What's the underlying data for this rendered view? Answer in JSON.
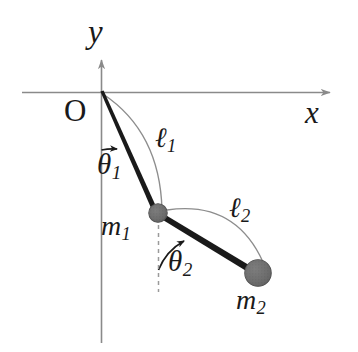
{
  "figure": {
    "background_color": "#ffffff",
    "stroke_color": "#1a1a1a",
    "axis_color": "#8a8a8a",
    "arc_color": "#7d7d7d",
    "bob_fill_color": "#6e6e6e",
    "bob_edge_color": "#4a4a4a",
    "dashed_color": "#9a9a9a",
    "rod_color": "#1a1a1a"
  },
  "axes": {
    "y_axis_label": "y",
    "x_axis_label": "x",
    "origin_label": "O",
    "origin_point": {
      "x": 101,
      "y": 92
    },
    "x_axis": {
      "x1": 22,
      "y1": 92,
      "x2": 334,
      "y2": 92,
      "arrow": "right"
    },
    "y_axis": {
      "x1": 101,
      "y1": 343,
      "x2": 101,
      "y2": 55,
      "arrow": "up"
    }
  },
  "pendulum": {
    "rod1": {
      "name": "rod-1",
      "from": {
        "x": 101,
        "y": 92
      },
      "to": {
        "x": 158,
        "y": 213
      },
      "length_label": "ℓ",
      "length_sub": "1"
    },
    "rod2": {
      "name": "rod-2",
      "from": {
        "x": 158,
        "y": 213
      },
      "to": {
        "x": 258,
        "y": 273
      },
      "length_label": "ℓ",
      "length_sub": "2"
    },
    "bob1": {
      "name": "mass-1",
      "label": "m",
      "sub": "1",
      "center": {
        "x": 158,
        "y": 213
      },
      "radius": 9
    },
    "bob2": {
      "name": "mass-2",
      "label": "m",
      "sub": "2",
      "center": {
        "x": 258,
        "y": 273
      },
      "radius": 13
    },
    "angle1": {
      "name": "theta-1",
      "label": "θ",
      "sub": "1",
      "vertex": {
        "x": 101,
        "y": 92
      },
      "from_axis": "downward-vertical",
      "degrees": 25
    },
    "angle2": {
      "name": "theta-2",
      "label": "θ",
      "sub": "2",
      "vertex": {
        "x": 158,
        "y": 213
      },
      "from_axis": "downward-vertical",
      "degrees": 59
    },
    "dashed_vertical": {
      "name": "vertical-reference-line",
      "from": {
        "x": 158,
        "y": 216
      },
      "to": {
        "x": 158,
        "y": 292
      }
    }
  }
}
